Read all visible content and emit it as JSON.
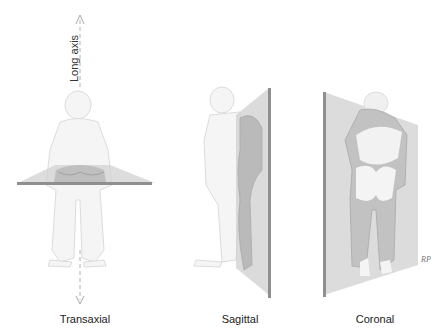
{
  "axis": {
    "label": "Long axis"
  },
  "panels": [
    {
      "id": "transaxial",
      "label": "Transaxial"
    },
    {
      "id": "sagittal",
      "label": "Sagittal"
    },
    {
      "id": "coronal",
      "label": "Coronal"
    }
  ],
  "signature": "RP",
  "colors": {
    "figure_outline": "#d8d8d8",
    "figure_fill": "#f4f4f4",
    "plane_fill": "#d9d9d9",
    "plane_edge": "#8a8a8a",
    "section_fill": "#bdbdbd",
    "axis_arrow": "#aaaaaa"
  }
}
